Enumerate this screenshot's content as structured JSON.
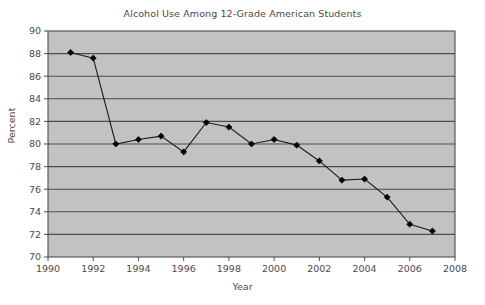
{
  "chart_data": {
    "type": "line",
    "title": "Alcohol Use Among 12-Grade American Students",
    "xlabel": "Year",
    "ylabel": "Percent",
    "xlim": [
      1990,
      2008
    ],
    "ylim": [
      70,
      90
    ],
    "xticks": [
      1990,
      1992,
      1994,
      1996,
      1998,
      2000,
      2002,
      2004,
      2006,
      2008
    ],
    "yticks": [
      70,
      72,
      74,
      76,
      78,
      80,
      82,
      84,
      86,
      88,
      90
    ],
    "grid": "horizontal",
    "legend": "none",
    "marker": "diamond",
    "plot_background": "#c2c2c2",
    "gridline_color": "#4d4d4d",
    "line_color": "#1a1a1a",
    "marker_color": "#000000",
    "x": [
      1991,
      1992,
      1993,
      1994,
      1995,
      1996,
      1997,
      1998,
      1999,
      2000,
      2001,
      2002,
      2003,
      2004,
      2005,
      2006,
      2007
    ],
    "values": [
      88.1,
      87.6,
      80.0,
      80.4,
      80.7,
      79.3,
      81.9,
      81.5,
      80.0,
      80.4,
      79.9,
      78.5,
      76.8,
      76.9,
      75.3,
      72.9,
      72.3
    ],
    "series": [
      {
        "name": "Alcohol use",
        "values": [
          88.1,
          87.6,
          80.0,
          80.4,
          80.7,
          79.3,
          81.9,
          81.5,
          80.0,
          80.4,
          79.9,
          78.5,
          76.8,
          76.9,
          75.3,
          72.9,
          72.3
        ]
      }
    ]
  }
}
